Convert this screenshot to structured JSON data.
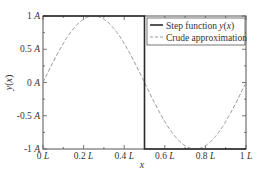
{
  "chart_data": {
    "type": "line",
    "title": "",
    "xlabel": "x",
    "ylabel": "y(x)",
    "xlim": [
      0,
      1
    ],
    "ylim": [
      -1,
      1
    ],
    "x_ticks": [
      0,
      0.2,
      0.4,
      0.6,
      0.8,
      1
    ],
    "x_tick_labels": [
      "0 L",
      "0.2 L",
      "0.4 L",
      "0.6 L",
      "0.8 L",
      "1 L"
    ],
    "y_ticks": [
      -1,
      -0.5,
      0,
      0.5,
      1
    ],
    "y_tick_labels": [
      "-1 A",
      "-0.5 A",
      "0 A",
      "0.5 A",
      "1 A"
    ],
    "grid": false,
    "legend_position": "upper right",
    "series": [
      {
        "name": "Step function y(x)",
        "style": "solid",
        "color": "#222222",
        "x": [
          0,
          0.5,
          0.5,
          1
        ],
        "y": [
          1,
          1,
          -1,
          -1
        ]
      },
      {
        "name": "Crude approximation",
        "style": "dashed",
        "color": "#999999",
        "x": [
          0,
          0.05,
          0.1,
          0.15,
          0.2,
          0.25,
          0.3,
          0.35,
          0.4,
          0.45,
          0.5,
          0.55,
          0.6,
          0.65,
          0.7,
          0.75,
          0.8,
          0.85,
          0.9,
          0.95,
          1
        ],
        "y": [
          0,
          0.309,
          0.588,
          0.809,
          0.951,
          1,
          0.951,
          0.809,
          0.588,
          0.309,
          0,
          -0.309,
          -0.588,
          -0.809,
          -0.951,
          -1,
          -0.951,
          -0.809,
          -0.588,
          -0.309,
          0
        ]
      }
    ]
  },
  "legend": {
    "items": [
      {
        "label_main": "Step function ",
        "label_italic": "y",
        "label_paren_open": "(",
        "label_italic2": "x",
        "label_paren_close": ")"
      },
      {
        "label_main": "Crude approximation"
      }
    ]
  },
  "axes": {
    "xlabel": "x",
    "ylabel_y": "y",
    "ylabel_open": "(",
    "ylabel_x": "x",
    "ylabel_close": ")"
  }
}
